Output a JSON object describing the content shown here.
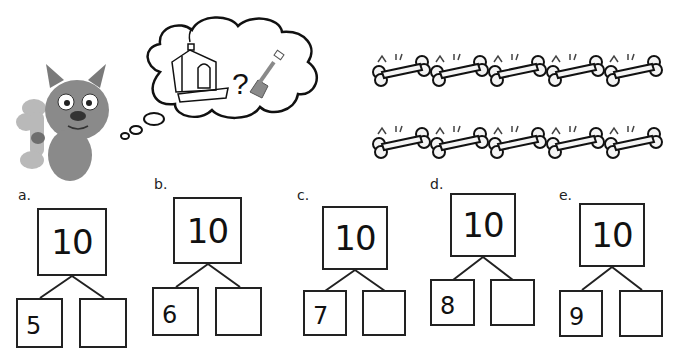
{
  "illustration": {
    "character": "cartoon puppy holding a bone",
    "thought_bubble": {
      "items": [
        "doghouse-icon",
        "question-mark",
        "shovel-icon"
      ],
      "question_mark": "?"
    },
    "bones": {
      "rows": 2,
      "per_row": 5,
      "total": 10
    }
  },
  "number_bonds": [
    {
      "label": "a.",
      "whole": "10",
      "part1": "5",
      "part2": ""
    },
    {
      "label": "b.",
      "whole": "10",
      "part1": "6",
      "part2": ""
    },
    {
      "label": "c.",
      "whole": "10",
      "part1": "7",
      "part2": ""
    },
    {
      "label": "d.",
      "whole": "10",
      "part1": "8",
      "part2": ""
    },
    {
      "label": "e.",
      "whole": "10",
      "part1": "9",
      "part2": ""
    }
  ],
  "colors": {
    "ink": "#222222",
    "puppy": "#8a8a8a",
    "bone_fill": "#f4f4f4"
  }
}
